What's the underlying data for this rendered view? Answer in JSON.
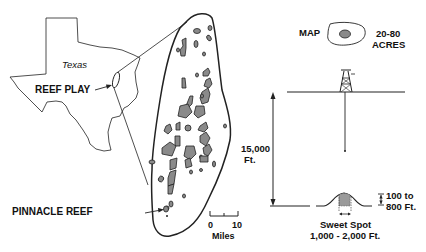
{
  "texas_map": {
    "state_label": "Texas",
    "reef_play_label": "REEF PLAY"
  },
  "reef_trend_map": {
    "pinnacle_reef_label": "PINNACLE REEF",
    "scale_bar": {
      "min": "0",
      "max": "10",
      "unit": "Miles"
    }
  },
  "map_inset": {
    "label": "MAP",
    "area_line1": "20-80",
    "area_line2": "ACRES"
  },
  "cross_section": {
    "depth_line1": "15,000",
    "depth_line2": "Ft.",
    "height_line1": "100 to",
    "height_line2": "800 Ft.",
    "sweet_spot_line1": "Sweet Spot",
    "sweet_spot_line2": "1,000 - 2,000 Ft."
  },
  "colors": {
    "line": "#222222",
    "reef_fill": "#8a8a8a",
    "background": "#ffffff"
  }
}
